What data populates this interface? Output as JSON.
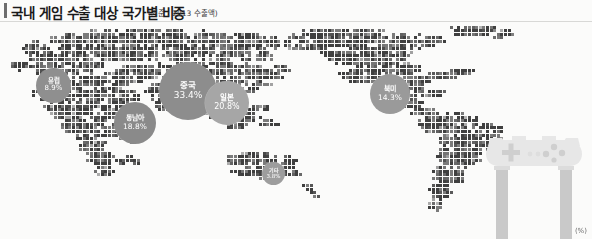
{
  "header": {
    "title": "국내 게임 수출 대상 국가별 비중",
    "note": "(기준 : 2013 수출액)"
  },
  "footer": {
    "unit_label": "(%)"
  },
  "icons": {
    "gamepad": "gamepad-icon"
  },
  "colors": {
    "background": "#fbfbfa",
    "title_text": "#1a1a1a",
    "title_accent": "#6d6d6d",
    "rule": "#d8d8d6",
    "bubble_label": "#ffffff",
    "map_tile_dark": "#3f3f3f",
    "map_tile_mid": "#7b7b7b",
    "map_tile_light": "#b4b4b4",
    "gamepad": "#e7e7e7"
  },
  "chart_data": {
    "type": "bubble",
    "title": "국내 게임 수출 대상 국가별 비중",
    "subtitle": "(기준 : 2013 수출액)",
    "unit": "(%)",
    "xlabel": "",
    "ylabel": "",
    "categories": [
      "중국",
      "일본",
      "동남아",
      "북미",
      "유럽",
      "기타"
    ],
    "values": [
      33.4,
      20.8,
      18.8,
      14.3,
      8.9,
      3.8
    ],
    "legend_position": "none",
    "grid": false,
    "bubbles": [
      {
        "id": "china",
        "name": "중국",
        "value": "33.4%",
        "pct": 33.4,
        "color": "#8d8d8d"
      },
      {
        "id": "japan",
        "name": "일본",
        "value": "20.8%",
        "pct": 20.8,
        "color": "#a6a6a6"
      },
      {
        "id": "sea",
        "name": "동남아",
        "value": "18.8%",
        "pct": 18.8,
        "color": "#8a8a8a"
      },
      {
        "id": "namerica",
        "name": "북미",
        "value": "14.3%",
        "pct": 14.3,
        "color": "#9a9a9a"
      },
      {
        "id": "europe",
        "name": "유럽",
        "value": "8.9%",
        "pct": 8.9,
        "color": "#8f8f8f"
      },
      {
        "id": "other",
        "name": "기타",
        "value": "3.8%",
        "pct": 3.8,
        "color": "#9d9d9d"
      }
    ]
  }
}
